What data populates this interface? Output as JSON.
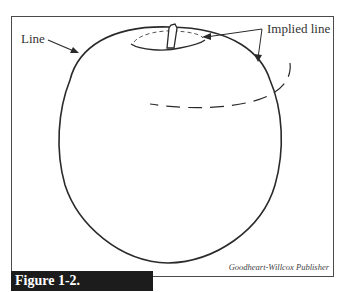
{
  "figure": {
    "caption": "Figure 1-2.",
    "credit": "Goodheart-Willcox Publisher"
  },
  "labels": {
    "line": "Line",
    "implied_line": "Implied line"
  },
  "colors": {
    "stroke": "#2a2a2a",
    "frame": "#4a4a4a",
    "caption_bg": "#1c1c1c",
    "caption_text": "#ffffff"
  }
}
